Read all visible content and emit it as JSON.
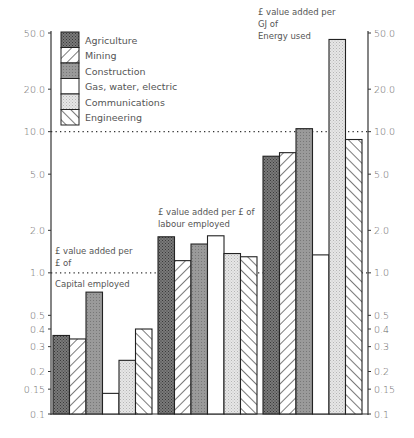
{
  "chart_data": {
    "type": "bar",
    "title": "",
    "xlabel": "",
    "ylabel": "",
    "yscale": "log",
    "ylim": [
      0.1,
      50
    ],
    "grid": false,
    "legend_position": "top-left",
    "left_axis_ticks": [
      "50.0",
      "20.0",
      "10.0",
      "5.0",
      "2.0",
      "1.0",
      "0.5",
      "0.4",
      "0.3",
      "0.2",
      "0.15",
      "0.1"
    ],
    "left_axis_values": [
      50,
      20,
      10,
      5,
      2,
      1,
      0.5,
      0.4,
      0.3,
      0.2,
      0.15,
      0.1
    ],
    "right_axis_ticks": [
      "50.0",
      "20.0",
      "10.0",
      "5.0",
      "2.0",
      "1.0",
      "0.5",
      "0.4",
      "0.3",
      "0.2",
      "0.15",
      "0.1"
    ],
    "right_axis_values": [
      50,
      20,
      10,
      5,
      2,
      1,
      0.5,
      0.4,
      0.3,
      0.2,
      0.15,
      0.1
    ],
    "reference_lines": [
      {
        "value": 10,
        "style": "dotted",
        "span": "from-energy-group"
      },
      {
        "value": 1,
        "style": "dotted",
        "span": "full"
      }
    ],
    "categories": [
      "£ value added per £ of Capital employed",
      "£ value added per £ of labour employed",
      "£ value added per GJ of Energy used"
    ],
    "annotations": [
      {
        "group": 0,
        "lines": [
          "£ value added per",
          "£ of"
        ],
        "below_line": "Capital employed"
      },
      {
        "group": 1,
        "lines": [
          "£ value added per £ of",
          "labour employed"
        ]
      },
      {
        "group": 2,
        "lines": [
          "£ value added per",
          "GJ of",
          "Energy used"
        ]
      }
    ],
    "series": [
      {
        "name": "Agriculture",
        "pattern": "dark-crosshatch",
        "values": [
          0.36,
          1.8,
          6.7
        ]
      },
      {
        "name": "Mining",
        "pattern": "diagonal-forward",
        "values": [
          0.34,
          1.22,
          7.1
        ]
      },
      {
        "name": "Construction",
        "pattern": "medium-gray",
        "values": [
          0.73,
          1.6,
          10.5
        ]
      },
      {
        "name": "Gas, water, electric",
        "pattern": "white",
        "values": [
          0.14,
          1.83,
          1.34
        ]
      },
      {
        "name": "Communications",
        "pattern": "light-dotted",
        "values": [
          0.24,
          1.37,
          45
        ]
      },
      {
        "name": "Engineering",
        "pattern": "diagonal-back",
        "values": [
          0.4,
          1.3,
          8.8
        ]
      }
    ]
  }
}
